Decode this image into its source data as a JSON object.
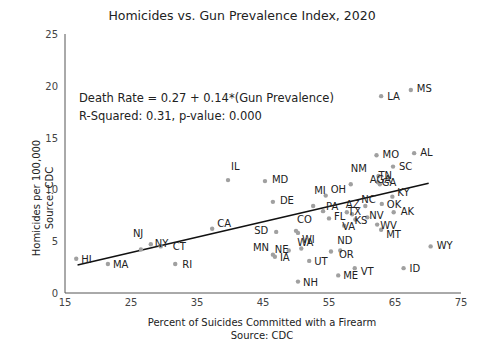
{
  "chart_data": {
    "type": "scatter",
    "title": "Homicides vs. Gun Prevalence Index, 2020",
    "xlabel": "Percent of Suicides Committed with a Firearm",
    "xlabel_source": "Source: CDC",
    "ylabel": "Homicides per 100,000",
    "ylabel_source": "Source: CDC",
    "xlim": [
      15,
      75
    ],
    "ylim": [
      0,
      25
    ],
    "xticks": [
      15,
      25,
      35,
      45,
      55,
      65,
      75
    ],
    "yticks": [
      0,
      5,
      10,
      15,
      20,
      25
    ],
    "grid": false,
    "annotation": {
      "equation": "Death Rate = 0.27 + 0.14*(Gun Prevalence)",
      "stats": "R-Squared: 0.31, p-value: 0.000"
    },
    "trendline": {
      "x": [
        16.9,
        70.1
      ],
      "y": [
        2.7,
        10.6
      ]
    },
    "points": [
      {
        "state": "HI",
        "x": 16.7,
        "y": 3.3
      },
      {
        "state": "MA",
        "x": 21.5,
        "y": 2.8
      },
      {
        "state": "NJ",
        "x": 26.5,
        "y": 4.2
      },
      {
        "state": "NY",
        "x": 28.0,
        "y": 4.7
      },
      {
        "state": "CT",
        "x": 29.5,
        "y": 4.5
      },
      {
        "state": "RI",
        "x": 31.7,
        "y": 2.8
      },
      {
        "state": "CA",
        "x": 37.3,
        "y": 6.2
      },
      {
        "state": "IL",
        "x": 39.7,
        "y": 10.9
      },
      {
        "state": "MD",
        "x": 45.3,
        "y": 10.8
      },
      {
        "state": "DE",
        "x": 46.5,
        "y": 8.8
      },
      {
        "state": "SD",
        "x": 47.0,
        "y": 5.9
      },
      {
        "state": "MN",
        "x": 46.5,
        "y": 3.7
      },
      {
        "state": "IA",
        "x": 46.8,
        "y": 3.5
      },
      {
        "state": "NE",
        "x": 48.9,
        "y": 4.1
      },
      {
        "state": "CO",
        "x": 50.0,
        "y": 6.0
      },
      {
        "state": "WI",
        "x": 50.3,
        "y": 5.8
      },
      {
        "state": "WA",
        "x": 50.8,
        "y": 4.3
      },
      {
        "state": "NH",
        "x": 50.3,
        "y": 1.1
      },
      {
        "state": "UT",
        "x": 52.0,
        "y": 3.1
      },
      {
        "state": "MI",
        "x": 52.6,
        "y": 8.4
      },
      {
        "state": "OH",
        "x": 54.5,
        "y": 9.4
      },
      {
        "state": "PA",
        "x": 54.1,
        "y": 7.9
      },
      {
        "state": "FL",
        "x": 55.0,
        "y": 7.2
      },
      {
        "state": "OR",
        "x": 55.3,
        "y": 4.0
      },
      {
        "state": "ND",
        "x": 56.7,
        "y": 4.1
      },
      {
        "state": "ME",
        "x": 56.4,
        "y": 1.7
      },
      {
        "state": "VA",
        "x": 57.3,
        "y": 6.5
      },
      {
        "state": "AZ",
        "x": 57.7,
        "y": 7.8
      },
      {
        "state": "NM",
        "x": 58.3,
        "y": 10.5
      },
      {
        "state": "TX",
        "x": 58.5,
        "y": 7.6
      },
      {
        "state": "KS",
        "x": 59.0,
        "y": 7.1
      },
      {
        "state": "VT",
        "x": 58.9,
        "y": 2.4
      },
      {
        "state": "NC",
        "x": 60.5,
        "y": 8.4
      },
      {
        "state": "NV",
        "x": 60.8,
        "y": 7.3
      },
      {
        "state": "GA",
        "x": 62.7,
        "y": 10.5
      },
      {
        "state": "OK",
        "x": 63.0,
        "y": 8.6
      },
      {
        "state": "WV",
        "x": 62.3,
        "y": 6.6
      },
      {
        "state": "MT",
        "x": 62.9,
        "y": 6.1
      },
      {
        "state": "MO",
        "x": 62.2,
        "y": 13.3
      },
      {
        "state": "TN",
        "x": 62.5,
        "y": 11.3
      },
      {
        "state": "AGA",
        "x": 62.4,
        "y": 10.7
      },
      {
        "state": "LA",
        "x": 62.9,
        "y": 19.0
      },
      {
        "state": "SC",
        "x": 64.7,
        "y": 12.2
      },
      {
        "state": "KY",
        "x": 64.6,
        "y": 9.3
      },
      {
        "state": "AK",
        "x": 64.8,
        "y": 7.8
      },
      {
        "state": "MS",
        "x": 67.4,
        "y": 19.6
      },
      {
        "state": "AL",
        "x": 67.9,
        "y": 13.5
      },
      {
        "state": "ID",
        "x": 66.3,
        "y": 2.4
      },
      {
        "state": "WY",
        "x": 70.4,
        "y": 4.5
      }
    ]
  },
  "labels": {
    "title": "Homicides vs. Gun Prevalence Index, 2020",
    "equation": "Death Rate = 0.27 + 0.14*(Gun Prevalence)",
    "stats": "R-Squared: 0.31, p-value: 0.000",
    "xlabel": "Percent of Suicides Committed with a Firearm",
    "xsource": "Source: CDC",
    "ylabel": "Homicides per 100,000",
    "ysource": "Source: CDC"
  },
  "colors": {
    "point": "#a0a0a0",
    "line": "#111111",
    "axis": "#555555"
  }
}
